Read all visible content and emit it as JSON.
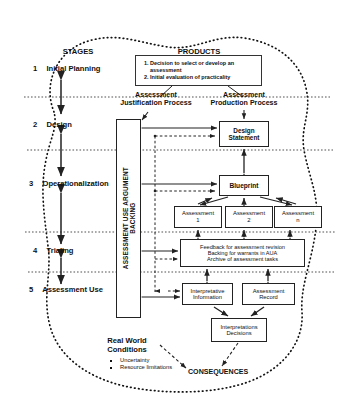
{
  "diagram": {
    "column_headers": {
      "stages": "STAGES",
      "products": "PRODUCTS"
    },
    "stages": [
      {
        "num": "1",
        "label": "Initial Planning"
      },
      {
        "num": "2",
        "label": "Design"
      },
      {
        "num": "3",
        "label": "Operationalization"
      },
      {
        "num": "4",
        "label": "Trialing"
      },
      {
        "num": "5",
        "label": "Assessment Use"
      }
    ],
    "process_headers": [
      {
        "line1": "Assessment",
        "line2": "Justification Process"
      },
      {
        "line1": "Assessment",
        "line2": "Production Process"
      }
    ],
    "products_box": {
      "items": [
        "Decision to select or develop an assessment",
        "Initial evaluation of practicality"
      ]
    },
    "aua_backing": {
      "line1": "ASSESSMENT USE ARGUMENT",
      "line2": "BACKING"
    },
    "boxes": {
      "design_statement": {
        "line1": "Design",
        "line2": "Statement"
      },
      "blueprint": {
        "line1": "Blueprint"
      },
      "assessment_1": {
        "line1": "Assessment",
        "line2": "1"
      },
      "assessment_2": {
        "line1": "Assessment",
        "line2": "2"
      },
      "assessment_n": {
        "line1": "Assessment",
        "line2": "n"
      },
      "feedback": {
        "line1": "Feedback for assessment revision",
        "line2": "Backing for warrants in AUA",
        "line3": "Archive of assessment tasks"
      },
      "interpretative_information": {
        "line1": "Interpretative",
        "line2": "Information"
      },
      "assessment_record": {
        "line1": "Assessment",
        "line2": "Record"
      },
      "interpretations_decisions": {
        "line1": "Interpretations",
        "line2": "Decisions"
      }
    },
    "real_world": {
      "title_line1": "Real World",
      "title_line2": "Conditions",
      "bullets": [
        "Uncertainty",
        "Resource limitations"
      ]
    },
    "consequences": "CONSEQUENCES",
    "colors": {
      "ink": "#111111",
      "line": "#222222",
      "paper": "#ffffff"
    }
  }
}
